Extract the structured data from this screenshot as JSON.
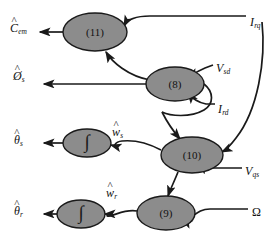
{
  "figure": {
    "type": "signal-flow-block-diagram",
    "background_color": "#ffffff",
    "node_fill_color": "#8c8c8c",
    "node_stroke_color": "#1a1a1a",
    "arrow_color": "#1a1a1a"
  },
  "nodes": [
    {
      "id": "node-11",
      "label": "(11)",
      "cx": 95,
      "cy": 32,
      "rx": 32,
      "ry": 19
    },
    {
      "id": "node-8",
      "label": "(8)",
      "cx": 175,
      "cy": 84,
      "rx": 29,
      "ry": 17
    },
    {
      "id": "node-10",
      "label": "(10)",
      "cx": 192,
      "cy": 155,
      "rx": 31,
      "ry": 18
    },
    {
      "id": "node-9",
      "label": "(9)",
      "cx": 166,
      "cy": 213,
      "rx": 29,
      "ry": 17
    },
    {
      "id": "integ-s",
      "label": "∫",
      "cx": 87,
      "cy": 143,
      "rx": 24,
      "ry": 14
    },
    {
      "id": "integ-r",
      "label": "∫",
      "cx": 81,
      "cy": 214,
      "rx": 24,
      "ry": 14
    }
  ],
  "outputs": [
    {
      "id": "out-c-em",
      "symbol": "C",
      "hat": true,
      "sub": "em",
      "x": 10,
      "y": 22,
      "italic": true
    },
    {
      "id": "out-phi-s",
      "symbol": "Ø",
      "hat": true,
      "sub": "s",
      "x": 13,
      "y": 70,
      "italic": true
    },
    {
      "id": "out-theta-s",
      "symbol": "θ",
      "hat": true,
      "sub": "s",
      "x": 14,
      "y": 134,
      "italic": true
    },
    {
      "id": "out-theta-r",
      "symbol": "θ",
      "hat": true,
      "sub": "r",
      "x": 14,
      "y": 205,
      "italic": true
    }
  ],
  "inputs": [
    {
      "id": "in-i-rq",
      "symbol": "I",
      "hat": false,
      "sub": "rq",
      "x": 250,
      "y": 16,
      "italic": true
    },
    {
      "id": "in-v-sd",
      "symbol": "V",
      "hat": false,
      "sub": "sd",
      "x": 216,
      "y": 62,
      "italic": true
    },
    {
      "id": "in-i-rd",
      "symbol": "I",
      "hat": false,
      "sub": "rd",
      "x": 218,
      "y": 103,
      "italic": true
    },
    {
      "id": "in-v-qs",
      "symbol": "V",
      "hat": false,
      "sub": "qs",
      "x": 245,
      "y": 165,
      "italic": true
    },
    {
      "id": "in-omega",
      "symbol": "Ω",
      "hat": false,
      "sub": "",
      "x": 252,
      "y": 206,
      "italic": false
    }
  ],
  "internal_signals": [
    {
      "id": "sig-w-s",
      "symbol": "w",
      "hat": true,
      "sub": "s",
      "x": 112,
      "y": 126,
      "italic": true
    },
    {
      "id": "sig-w-r",
      "symbol": "w",
      "hat": true,
      "sub": "r",
      "x": 106,
      "y": 187,
      "italic": true
    }
  ]
}
